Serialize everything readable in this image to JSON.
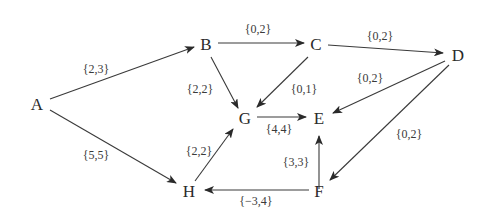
{
  "diagram": {
    "type": "directed-graph",
    "nodes": [
      {
        "id": "A",
        "label": "A",
        "x": 37,
        "y": 104
      },
      {
        "id": "B",
        "label": "B",
        "x": 204,
        "y": 44
      },
      {
        "id": "C",
        "label": "C",
        "x": 316,
        "y": 44
      },
      {
        "id": "D",
        "label": "D",
        "x": 458,
        "y": 55
      },
      {
        "id": "G",
        "label": "G",
        "x": 242,
        "y": 122
      },
      {
        "id": "E",
        "label": "E",
        "x": 319,
        "y": 122
      },
      {
        "id": "H",
        "label": "H",
        "x": 188,
        "y": 193
      },
      {
        "id": "F",
        "label": "F",
        "x": 319,
        "y": 190
      }
    ],
    "edges": [
      {
        "from": "A",
        "to": "B",
        "label": "{2,3}"
      },
      {
        "from": "A",
        "to": "H",
        "label": "{5,5}"
      },
      {
        "from": "B",
        "to": "C",
        "label": "{0,2}"
      },
      {
        "from": "C",
        "to": "D",
        "label": "{0,2}"
      },
      {
        "from": "B",
        "to": "G",
        "label": "{2,2}"
      },
      {
        "from": "C",
        "to": "G",
        "label": "{0,1}"
      },
      {
        "from": "D",
        "to": "E",
        "label": "{0,2}"
      },
      {
        "from": "G",
        "to": "E",
        "label": "{4,4}"
      },
      {
        "from": "H",
        "to": "G",
        "label": "{2,2}"
      },
      {
        "from": "F",
        "to": "E",
        "label": "{3,3}"
      },
      {
        "from": "D",
        "to": "F",
        "label": "{0,2}"
      },
      {
        "from": "F",
        "to": "H",
        "label": "{−3,4}"
      }
    ]
  }
}
